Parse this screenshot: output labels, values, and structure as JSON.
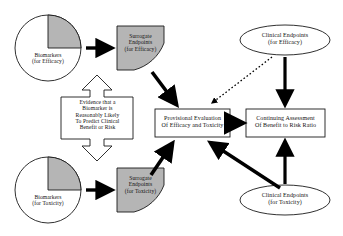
{
  "diagram": {
    "colors": {
      "shape_fill_shaded": "#b5b5b5",
      "shape_fill_plain": "#ffffff",
      "stroke": "#1a1a1a",
      "arrow_solid": "#000000",
      "arrow_hollow": "#ffffff",
      "background": "#ffffff"
    },
    "nodes": [
      {
        "id": "biomarkers-efficacy",
        "shape": "pie",
        "shaded_quadrant": "upper-right",
        "lines": [
          "Biomarkers",
          "(for Efficacy)"
        ]
      },
      {
        "id": "surrogate-endpoints-efficacy",
        "shape": "quadrant",
        "filled": true,
        "lines": [
          "Surrogate",
          "Endpoints",
          "(for Efficacy)"
        ]
      },
      {
        "id": "evidence-block",
        "shape": "double-headed-vertical-arrow",
        "filled": false,
        "lines": [
          "Evidence that a",
          "Biomarker is",
          "Reasonably Likely",
          "To Predict Clinical",
          "Benefit or Risk"
        ]
      },
      {
        "id": "biomarkers-toxicity",
        "shape": "pie",
        "shaded_quadrant": "upper-right",
        "lines": [
          "Biomarkers",
          "(for Toxicity)"
        ]
      },
      {
        "id": "surrogate-endpoints-toxicity",
        "shape": "quadrant",
        "filled": true,
        "lines": [
          "Surrogate",
          "Endpoints",
          "(for Toxicity)"
        ]
      },
      {
        "id": "provisional-evaluation",
        "shape": "rectangle",
        "lines": [
          "Provisional Evaluation",
          "Of Efficacy and Toxicity"
        ]
      },
      {
        "id": "continuing-assessment",
        "shape": "rectangle",
        "lines": [
          "Continuing Assessment",
          "Of Benefit to Risk Ratio"
        ]
      },
      {
        "id": "clinical-endpoints-efficacy",
        "shape": "ellipse",
        "lines": [
          "Clinical Endpoints",
          "(for Efficacy)"
        ]
      },
      {
        "id": "clinical-endpoints-toxicity",
        "shape": "ellipse",
        "lines": [
          "Clinical Endpoints",
          "(for Toxicity)"
        ]
      }
    ],
    "edges": [
      {
        "id": "biomarkers-efficacy-to-surrogate-efficacy",
        "style": "solid-thick",
        "direction": "right"
      },
      {
        "id": "biomarkers-toxicity-to-surrogate-toxicity",
        "style": "solid-thick",
        "direction": "right"
      },
      {
        "id": "surrogate-efficacy-to-provisional",
        "style": "solid-thick",
        "direction": "down-right"
      },
      {
        "id": "surrogate-toxicity-to-provisional",
        "style": "solid-thick",
        "direction": "up-right"
      },
      {
        "id": "clinical-endpoints-efficacy-to-provisional",
        "style": "dotted",
        "direction": "down-left"
      },
      {
        "id": "clinical-endpoints-efficacy-to-continuing",
        "style": "solid-thick",
        "direction": "down"
      },
      {
        "id": "clinical-endpoints-toxicity-to-continuing",
        "style": "solid-thick",
        "direction": "up"
      },
      {
        "id": "clinical-endpoints-toxicity-to-provisional",
        "style": "solid-thick",
        "direction": "up-left"
      },
      {
        "id": "provisional-to-continuing",
        "style": "solid-thick",
        "direction": "right"
      },
      {
        "id": "evidence-block-arrow-up",
        "style": "hollow",
        "direction": "up"
      },
      {
        "id": "evidence-block-arrow-down",
        "style": "hollow",
        "direction": "down"
      }
    ]
  }
}
